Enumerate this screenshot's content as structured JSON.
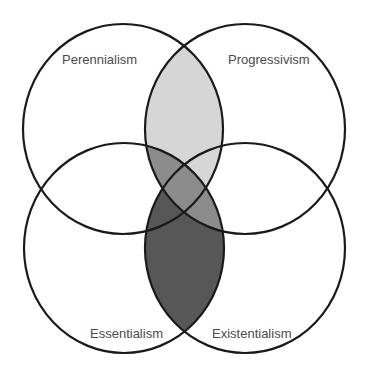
{
  "diagram": {
    "type": "venn-4",
    "sets": [
      {
        "id": "tl",
        "label": "Perennialism"
      },
      {
        "id": "tr",
        "label": "Progressivism"
      },
      {
        "id": "bl",
        "label": "Essentialism"
      },
      {
        "id": "br",
        "label": "Existentialism"
      }
    ],
    "shaded_regions": [
      {
        "sets": [
          "Perennialism",
          "Progressivism"
        ],
        "color": "#d6d6d6"
      },
      {
        "sets": [
          "Essentialism",
          "Existentialism"
        ],
        "color": "#575757"
      },
      {
        "sets": [
          "Progressivism",
          "Essentialism"
        ],
        "color": "#8c8c8c"
      }
    ],
    "colors": {
      "background": "#ffffff",
      "outline": "#1a1a1a",
      "label": "#4a4a4a",
      "light": "#d6d6d6",
      "mid": "#8c8c8c",
      "dark": "#575757"
    }
  }
}
